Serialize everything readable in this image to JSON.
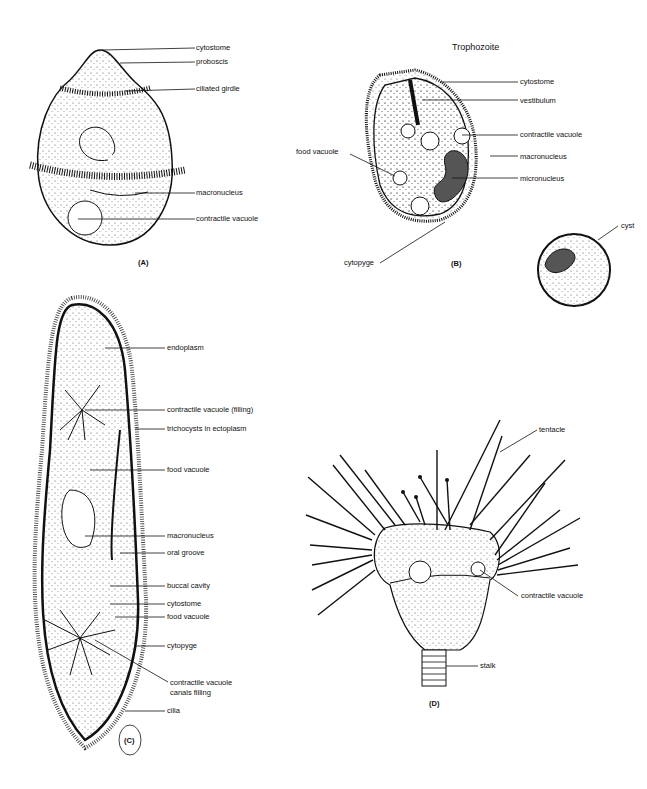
{
  "figure": {
    "panels": [
      {
        "id": "A",
        "caption": "(A)",
        "labels": [
          "cytostome",
          "proboscis",
          "ciliated girdle",
          "macronucleus",
          "contractile vacuole"
        ]
      },
      {
        "id": "B",
        "title": "Trophozoite",
        "caption": "(B)",
        "labels": [
          "cytostome",
          "vestibulum",
          "contractile vacuole",
          "macronucleus",
          "micronucleus",
          "food vacuole",
          "cytopyge",
          "cyst"
        ]
      },
      {
        "id": "C",
        "caption": "(C)",
        "labels": [
          "endoplasm",
          "contractile vacuole (filling)",
          "trichocysts in ectoplasm",
          "food vacuole",
          "macronucleus",
          "oral groove",
          "buccal cavity",
          "cytostome",
          "food vacuole",
          "cytopyge",
          "contractile vacuole",
          "canals filling",
          "cilia"
        ]
      },
      {
        "id": "D",
        "caption": "(D)",
        "labels": [
          "tentacle",
          "contractile vacuole",
          "stalk"
        ]
      }
    ]
  }
}
